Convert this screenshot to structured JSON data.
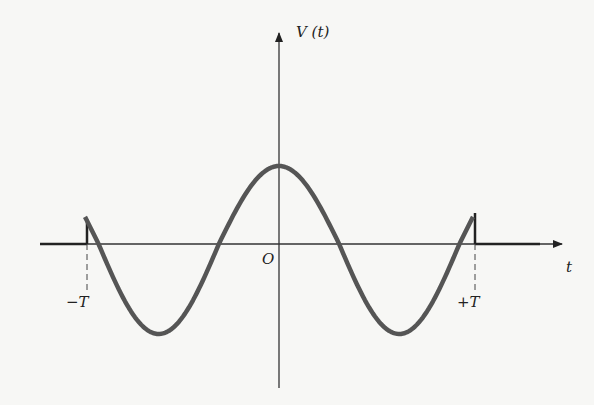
{
  "figure": {
    "y_axis_label": "V (t)",
    "x_axis_label": "t",
    "origin_label": "O",
    "neg_T_label": "−T",
    "pos_T_label": "+T"
  },
  "colors": {
    "curve": "#555555",
    "axes": "#333333",
    "background": "#f7f7f5"
  },
  "curve": {
    "description": "Cosine pulse truncated at ±T, zero outside",
    "function": "V(t)=cos(2πt/P) for |t|<=T, 0 otherwise",
    "period_over_T": 1.24
  }
}
